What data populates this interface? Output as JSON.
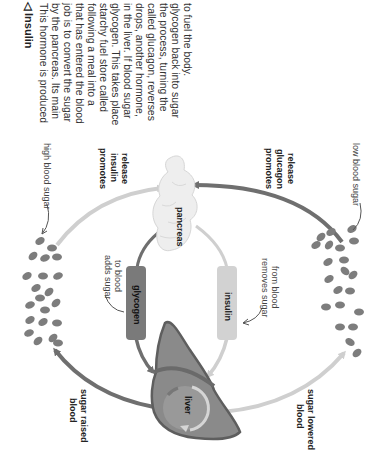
{
  "caption": {
    "heading_marker": "◁",
    "heading": "Insulin",
    "lines": [
      "This hormone is produced",
      "by the pancreas. Its main",
      "job is to convert the sugar",
      "that has entered the blood",
      "following a meal into a",
      "starchy fuel store called",
      "glycogen. This takes place",
      "in the liver. If blood sugar",
      "drops, another hormone,",
      "called glucagon, reverses",
      "the process, turning the",
      "glycogen back into sugar",
      "to fuel the body."
    ]
  },
  "diagram": {
    "organs": {
      "pancreas": "pancreas",
      "liver": "liver"
    },
    "hormone_boxes": {
      "glycogen": "glycogen",
      "insulin": "insulin"
    },
    "labels": {
      "high_blood_sugar": "high blood sugar",
      "low_blood_sugar": "low blood sugar",
      "promotes_insulin": [
        "promotes",
        "insulin",
        "release"
      ],
      "promotes_glucagon": [
        "promotes",
        "glucagon",
        "release"
      ],
      "adds_sugar": [
        "adds sugar",
        "to blood"
      ],
      "removes_sugar": [
        "removes sugar",
        "from blood"
      ],
      "sugar_raised": [
        "blood",
        "sugar raised"
      ],
      "sugar_lowered": [
        "blood",
        "sugar lowered"
      ]
    },
    "colors": {
      "dark_arrow": "#6f6f6f",
      "light_arrow": "#cfcfcf",
      "glycogen_box": "#7a7a7a",
      "insulin_box": "#d2d2d2",
      "pancreas": "#eeeeee",
      "liver": "#8a8a8a",
      "liver_edge": "#5e5e5e",
      "blood_cell": "#7d7d7d"
    }
  }
}
